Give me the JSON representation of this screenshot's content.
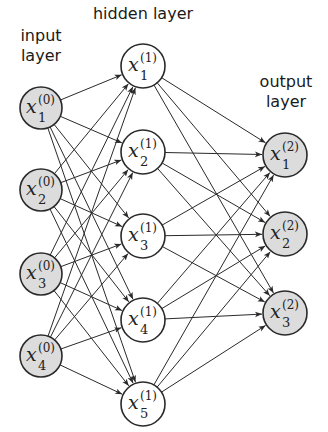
{
  "diagram": {
    "colors": {
      "background": "#ffffff",
      "edge": "#2a2a2a",
      "node_stroke": "#2a2a2a",
      "input_fill": "#dcdcdc",
      "hidden_fill": "#ffffff",
      "output_fill": "#dcdcdc"
    },
    "layers": [
      {
        "id": "input",
        "label": "input\nlayer",
        "label_pos": {
          "x": 41,
          "y": 36
        },
        "fill": "#dcdcdc",
        "radius": 21,
        "nodes": [
          {
            "var": "x",
            "sub": "1",
            "sup": "(0)",
            "cx": 41,
            "cy": 108
          },
          {
            "var": "x",
            "sub": "2",
            "sup": "(0)",
            "cx": 41,
            "cy": 190
          },
          {
            "var": "x",
            "sub": "3",
            "sup": "(0)",
            "cx": 41,
            "cy": 274
          },
          {
            "var": "x",
            "sub": "4",
            "sup": "(0)",
            "cx": 41,
            "cy": 356
          }
        ]
      },
      {
        "id": "hidden",
        "label": "hidden layer",
        "label_pos": {
          "x": 143,
          "y": 14
        },
        "fill": "#ffffff",
        "radius": 22,
        "nodes": [
          {
            "var": "x",
            "sub": "1",
            "sup": "(1)",
            "cx": 143,
            "cy": 66
          },
          {
            "var": "x",
            "sub": "2",
            "sup": "(1)",
            "cx": 143,
            "cy": 152
          },
          {
            "var": "x",
            "sub": "3",
            "sup": "(1)",
            "cx": 143,
            "cy": 236
          },
          {
            "var": "x",
            "sub": "4",
            "sup": "(1)",
            "cx": 143,
            "cy": 320
          },
          {
            "var": "x",
            "sub": "5",
            "sup": "(1)",
            "cx": 143,
            "cy": 404
          }
        ]
      },
      {
        "id": "output",
        "label": "output\nlayer",
        "label_pos": {
          "x": 286,
          "y": 82
        },
        "fill": "#dcdcdc",
        "radius": 22,
        "nodes": [
          {
            "var": "x",
            "sub": "1",
            "sup": "(2)",
            "cx": 285,
            "cy": 155
          },
          {
            "var": "x",
            "sub": "2",
            "sup": "(2)",
            "cx": 285,
            "cy": 234
          },
          {
            "var": "x",
            "sub": "3",
            "sup": "(2)",
            "cx": 285,
            "cy": 313
          }
        ]
      }
    ],
    "connections": "fully-connected between adjacent layers, directed left to right with arrowheads"
  }
}
